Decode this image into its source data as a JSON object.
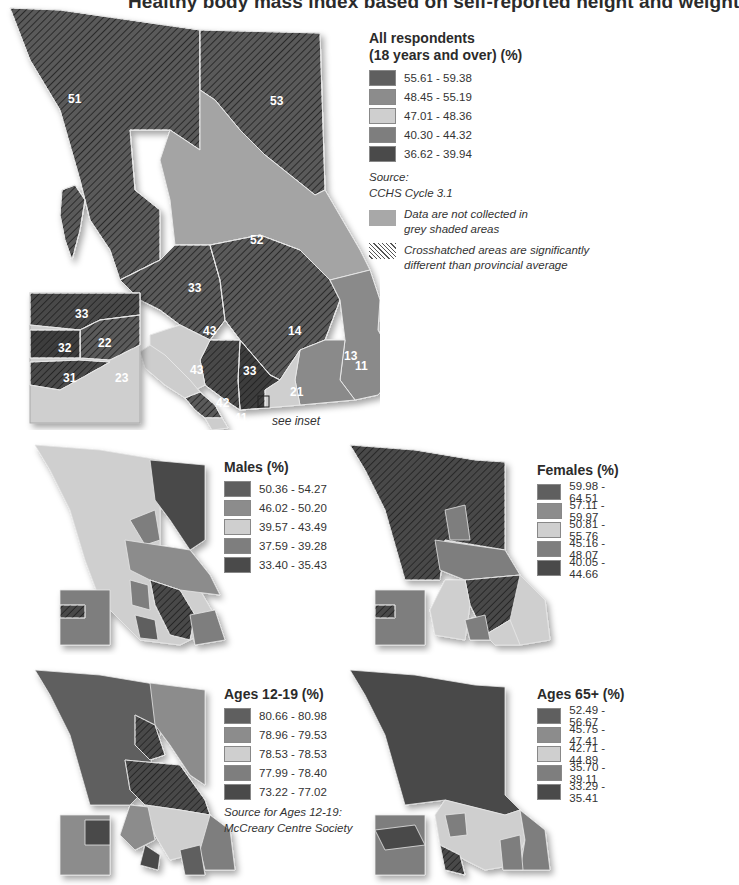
{
  "title": "Healthy body mass index based on self-reported height and weight",
  "colors": {
    "class1": "#5f5f5f",
    "class2": "#8c8c8c",
    "class3": "#cfcfcf",
    "class4": "#7e7e7e",
    "class5": "#4a4a4a",
    "no_data": "#a8a8a8",
    "hatch_line": "#222222",
    "boundary": "#e6e6e6"
  },
  "main_map": {
    "legend_title_line1": "All respondents",
    "legend_title_line2": "(18 years and over) (%)",
    "classes": [
      "55.61 - 59.38",
      "48.45 - 55.19",
      "47.01 - 48.36",
      "40.30 - 44.32",
      "36.62 - 39.94"
    ],
    "source_label": "Source:",
    "source_value": "CCHS Cycle 3.1",
    "no_data_note": [
      "Data are not collected in",
      "grey shaded areas"
    ],
    "hatch_note": [
      "Crosshatched areas are significantly",
      "different than provincial average"
    ],
    "see_inset": "see inset",
    "region_labels": {
      "r51": "51",
      "r53": "53",
      "r52": "52",
      "r33": "33",
      "r14": "14",
      "r43a": "43",
      "r43b": "43",
      "r13": "13",
      "r12": "12",
      "r11": "11",
      "r33b": "33",
      "r21": "21",
      "r42": "42",
      "r41": "41"
    },
    "inset_labels": {
      "i33": "33",
      "i32": "32",
      "i22": "22",
      "i31": "31",
      "i23": "23"
    }
  },
  "males": {
    "legend_title": "Males (%)",
    "classes": [
      "50.36 - 54.27",
      "46.02 - 50.20",
      "39.57 - 43.49",
      "37.59 - 39.28",
      "33.40 - 35.43"
    ]
  },
  "females": {
    "legend_title": "Females (%)",
    "classes": [
      "59.98 - 64.51",
      "57.11 - 59.97",
      "50.81 - 55.76",
      "45.16 - 48.07",
      "40.05 - 44.66"
    ]
  },
  "ages_12_19": {
    "legend_title": "Ages 12-19 (%)",
    "classes": [
      "80.66 - 80.98",
      "78.96 - 79.53",
      "78.53 - 78.53",
      "77.99 - 78.40",
      "73.22 - 77.02"
    ],
    "source_line1": "Source for Ages 12-19:",
    "source_line2": "McCreary Centre Society"
  },
  "ages_65": {
    "legend_title": "Ages 65+ (%)",
    "classes": [
      "52.49 - 56.67",
      "45.75 - 47.41",
      "42.71 - 44.89",
      "35.70 - 39.11",
      "33.29 - 35.41"
    ]
  }
}
